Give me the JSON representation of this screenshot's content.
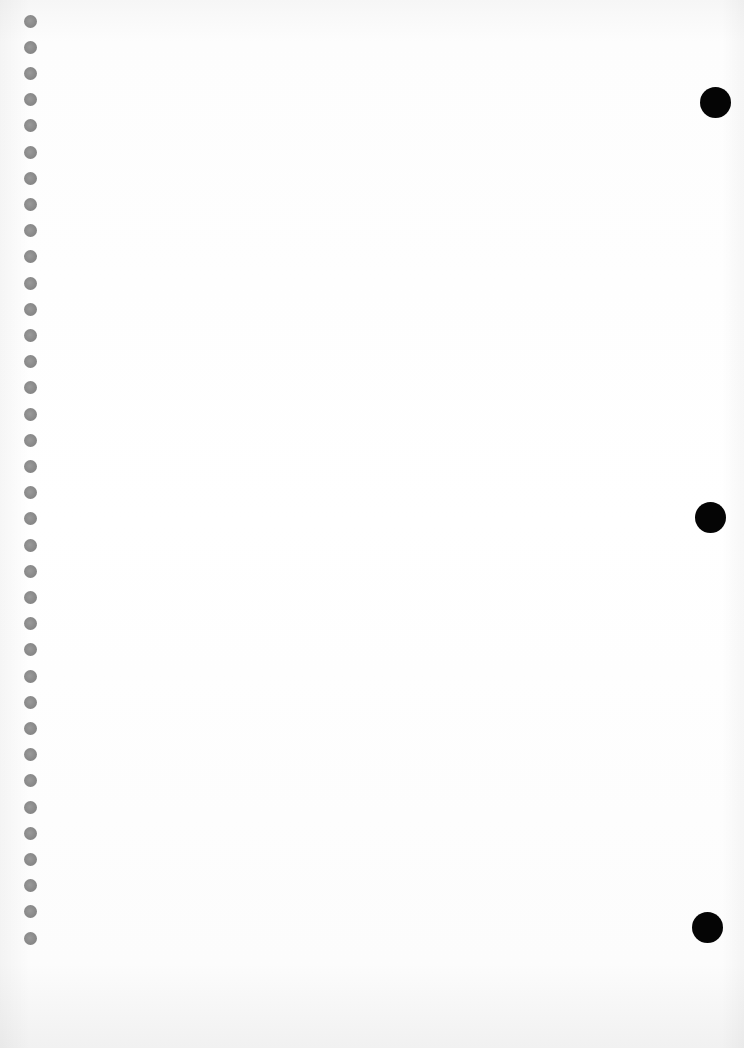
{
  "page": {
    "type": "blank-notebook-paper",
    "background_color": "#ffffff"
  },
  "left_holes": {
    "count": 36,
    "x": 30,
    "first_y": 21,
    "spacing": 26.2,
    "diameter": 13,
    "color": "#868686"
  },
  "right_holes": [
    {
      "x": 715,
      "y": 102
    },
    {
      "x": 710,
      "y": 517
    },
    {
      "x": 707,
      "y": 927
    }
  ],
  "right_hole_diameter": 31,
  "right_hole_color": "#050505"
}
